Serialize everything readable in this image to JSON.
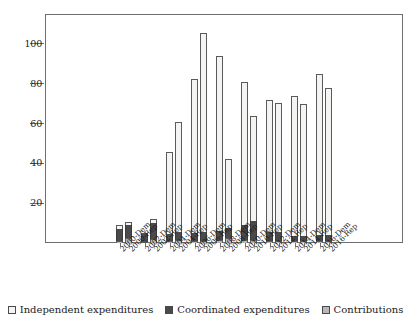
{
  "chart_data": {
    "type": "bar",
    "stacked": true,
    "title": "",
    "subtitle": "",
    "xlabel": "",
    "ylabel": "",
    "ylim": [
      0,
      115
    ],
    "yticks": [
      20,
      40,
      60,
      80,
      100
    ],
    "ytick_labels": [
      "20",
      "40",
      "60",
      "80",
      "100"
    ],
    "grid": false,
    "legend_position": "bottom",
    "categories": [
      "2000-Dem",
      "2000-Rep",
      "2002-Dem",
      "2002-Rep",
      "2004-Dem",
      "2004-Rep",
      "2006-Dem",
      "2006-Rep",
      "2008-Dem",
      "2008-Rep",
      "2010-Dem",
      "2010-Rep",
      "2012-Dem",
      "2012-Rep",
      "2014-Dem",
      "2014-Rep",
      "2016-Dem",
      "2016-Rep"
    ],
    "series": [
      {
        "name": "Contributions",
        "color": "#b8b8b8",
        "values": [
          1.0,
          2.5,
          0.5,
          2.0,
          1.0,
          1.5,
          1.0,
          1.0,
          1.5,
          2.5,
          1.5,
          1.5,
          1.0,
          1.0,
          1.0,
          1.0,
          1.0,
          1.0
        ]
      },
      {
        "name": "Coordinated expenditures",
        "color": "#4a4a4a",
        "values": [
          6.0,
          6.5,
          4.0,
          8.0,
          3.5,
          4.0,
          4.0,
          4.5,
          4.5,
          5.0,
          7.5,
          9.5,
          4.5,
          4.5,
          2.5,
          2.5,
          3.0,
          3.0
        ]
      },
      {
        "name": "Independent expenditures",
        "color": "#f4f4f2",
        "values": [
          2.0,
          1.5,
          0.5,
          2.0,
          41.0,
          55.5,
          77.5,
          100.0,
          88.0,
          34.5,
          72.0,
          53.0,
          66.5,
          65.0,
          70.5,
          66.5,
          81.0,
          74.0
        ]
      }
    ],
    "totals": [
      9.0,
      10.5,
      5.0,
      12.0,
      45.5,
      61.0,
      82.5,
      105.5,
      94.0,
      42.0,
      81.0,
      64.0,
      72.0,
      70.5,
      74.0,
      70.0,
      85.0,
      78.0
    ]
  },
  "legend": {
    "items": [
      {
        "label": "Independent expenditures",
        "swatch": "indep"
      },
      {
        "label": "Coordinated expenditures",
        "swatch": "coord"
      },
      {
        "label": "Contributions",
        "swatch": "contrib"
      }
    ]
  }
}
